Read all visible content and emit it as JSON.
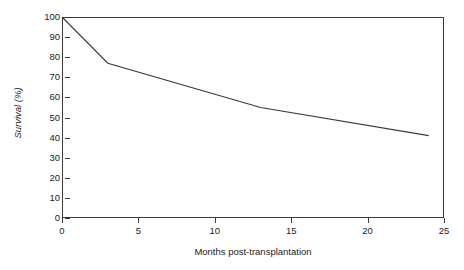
{
  "chart_data": {
    "type": "line",
    "title": "",
    "xlabel": "Months post-transplantation",
    "ylabel": "Survival (%)",
    "xlim": [
      0,
      25
    ],
    "ylim": [
      0,
      100
    ],
    "grid": false,
    "legend": false,
    "x_ticks": [
      0,
      5,
      10,
      15,
      20,
      25
    ],
    "x_tick_labels": [
      "0",
      "5",
      "10",
      "15",
      "20",
      "25"
    ],
    "y_ticks": [
      0,
      10,
      20,
      30,
      40,
      50,
      60,
      70,
      80,
      90,
      100
    ],
    "y_tick_labels": [
      "0",
      "10",
      "20",
      "30",
      "40",
      "50",
      "60",
      "70",
      "80",
      "90",
      "100"
    ],
    "series": [
      {
        "name": "Survival",
        "color": "#3a3a3a",
        "x": [
          0,
          3,
          13,
          24
        ],
        "values": [
          100,
          77,
          55,
          41
        ],
        "points": [
          {
            "x": 0,
            "y": 100
          },
          {
            "x": 3,
            "y": 77
          },
          {
            "x": 13,
            "y": 55
          },
          {
            "x": 24,
            "y": 41
          }
        ]
      }
    ]
  }
}
